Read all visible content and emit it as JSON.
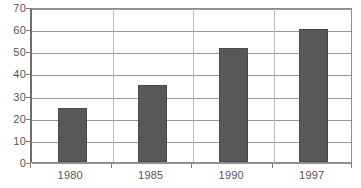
{
  "chart_data": {
    "type": "bar",
    "title": "",
    "subtitle": "",
    "xlabel": "",
    "ylabel": "",
    "categories": [
      "1980",
      "1985",
      "1990",
      "1997"
    ],
    "values": [
      24.5,
      35,
      51.5,
      60
    ],
    "ylim": [
      0,
      70
    ],
    "ytick_step": 10,
    "yticks": [
      "70",
      "60",
      "50",
      "40",
      "30",
      "20",
      "10",
      "0"
    ],
    "ytick_values": [
      70,
      60,
      50,
      40,
      30,
      20,
      10,
      0
    ],
    "grid": true,
    "grid_axis": "y",
    "legend": false,
    "legend_position": "none",
    "series": [
      {
        "name": "",
        "values": [
          24.5,
          35,
          51.5,
          60
        ]
      }
    ],
    "colors": {
      "bar_fill": "#585858",
      "bar_border": "#4a4a4a",
      "gridline": "#9a9a9a",
      "axis": "#6e6e6e",
      "tick_label": "#555555",
      "background": "#ffffff"
    }
  }
}
